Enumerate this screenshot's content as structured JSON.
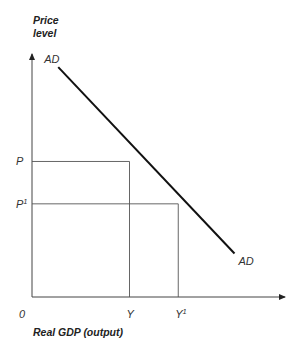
{
  "chart_data": {
    "type": "line",
    "title": "",
    "ylabel_lines": [
      "Price",
      "level"
    ],
    "xlabel": "Real GDP (output)",
    "origin_label": "0",
    "xlim": [
      0,
      10
    ],
    "ylim": [
      0,
      10
    ],
    "grid": false,
    "legend": "none",
    "series": [
      {
        "name": "AD",
        "label_start": "AD",
        "label_end": "AD",
        "points": [
          [
            1.05,
            9.5
          ],
          [
            8.1,
            1.8
          ]
        ]
      }
    ],
    "reference_points": [
      {
        "name": "P-Y",
        "x": 3.9,
        "y": 5.6,
        "x_label": "Y",
        "y_label": "P",
        "x_sup": "",
        "y_sup": ""
      },
      {
        "name": "P1-Y1",
        "x": 5.85,
        "y": 3.85,
        "x_label": "Y",
        "y_label": "P",
        "x_sup": "1",
        "y_sup": "1"
      }
    ]
  }
}
